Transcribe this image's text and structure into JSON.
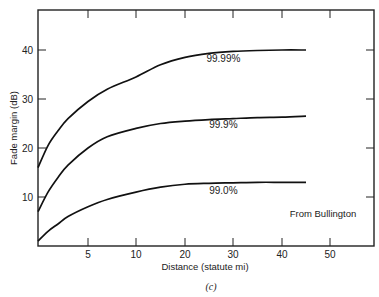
{
  "chart_data": {
    "type": "line",
    "title": "",
    "caption": "(c)",
    "xlabel": "Distance (statute mi)",
    "ylabel": "Fade margin (dB)",
    "annotation": "From Bullington",
    "xlim": [
      0,
      60
    ],
    "ylim": [
      0,
      47
    ],
    "x_ticks": [
      5,
      10,
      20,
      30,
      40,
      50
    ],
    "y_ticks": [
      10,
      20,
      30,
      40
    ],
    "grid": false,
    "series": [
      {
        "name": "99.99%",
        "x": [
          0,
          1,
          2,
          3,
          5,
          7,
          10,
          15,
          20,
          25,
          30,
          35,
          40,
          45
        ],
        "values": [
          16,
          20.5,
          23.5,
          26,
          29.5,
          32,
          34.5,
          37,
          38.5,
          39.3,
          39.7,
          39.9,
          40,
          40
        ]
      },
      {
        "name": "99.9%",
        "x": [
          0,
          1,
          2,
          3,
          5,
          7,
          10,
          15,
          20,
          25,
          30,
          35,
          40,
          45
        ],
        "values": [
          7,
          11,
          14,
          16.5,
          20,
          22.3,
          24,
          25,
          25.5,
          25.8,
          26,
          26.2,
          26.3,
          26.5
        ]
      },
      {
        "name": "99.0%",
        "x": [
          0,
          1,
          2,
          3,
          5,
          7,
          10,
          15,
          20,
          25,
          30,
          35,
          40,
          45
        ],
        "values": [
          1,
          3,
          4.5,
          6,
          8,
          9.5,
          11,
          12,
          12.6,
          12.8,
          12.9,
          13,
          13,
          13
        ]
      }
    ]
  }
}
